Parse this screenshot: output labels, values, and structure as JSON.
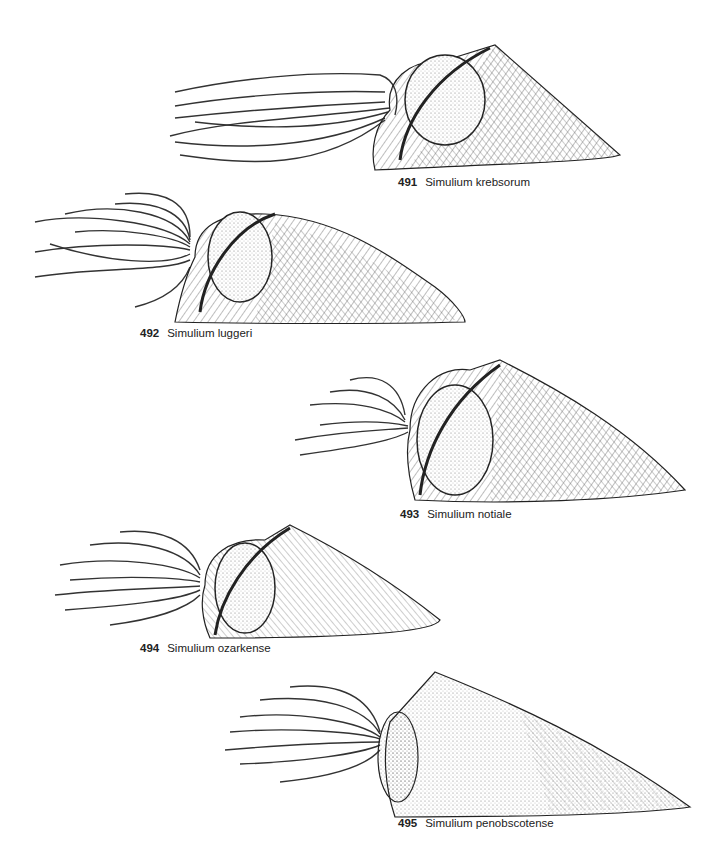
{
  "plate": {
    "figures": [
      {
        "number": "491",
        "species": "Simulium krebsorum"
      },
      {
        "number": "492",
        "species": "Simulium luggeri"
      },
      {
        "number": "493",
        "species": "Simulium notiale"
      },
      {
        "number": "494",
        "species": "Simulium ozarkense"
      },
      {
        "number": "495",
        "species": "Simulium penobscotense"
      }
    ]
  },
  "colors": {
    "ink": "#1a1a1a",
    "hatch": "#555555",
    "paper": "#ffffff"
  }
}
